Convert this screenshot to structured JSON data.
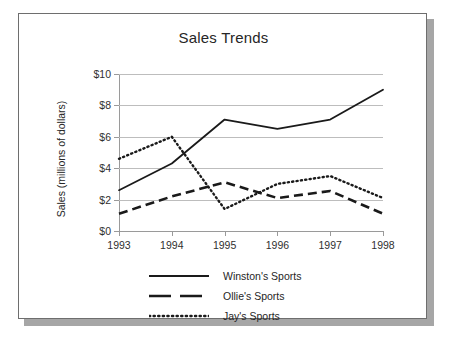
{
  "card": {
    "title": "Sales Trends"
  },
  "chart_data": {
    "type": "line",
    "title": "Sales Trends",
    "xlabel": "",
    "ylabel": "Sales (millions of dollars)",
    "x": [
      "1993",
      "1994",
      "1995",
      "1996",
      "1997",
      "1998"
    ],
    "xlim": [
      1993,
      1998
    ],
    "ylim": [
      0,
      10
    ],
    "yticks": [
      "$0",
      "$2",
      "$4",
      "$6",
      "$8",
      "$10"
    ],
    "ytick_values": [
      0,
      2,
      4,
      6,
      8,
      10
    ],
    "grid": true,
    "legend_position": "bottom",
    "series": [
      {
        "name": "Winston's Sports",
        "style": "solid",
        "color": "#1a1a1a",
        "values": [
          2.6,
          4.3,
          7.1,
          6.5,
          7.1,
          9.0
        ]
      },
      {
        "name": "Ollie's Sports",
        "style": "dashed",
        "color": "#1a1a1a",
        "values": [
          1.1,
          2.2,
          3.1,
          2.1,
          2.55,
          1.1
        ]
      },
      {
        "name": "Jay's Sports",
        "style": "dotted",
        "color": "#1a1a1a",
        "values": [
          4.6,
          6.0,
          1.4,
          3.0,
          3.5,
          2.1
        ]
      }
    ],
    "annotations": []
  },
  "legend": {
    "items": [
      {
        "label": "Winston's Sports",
        "style": "solid"
      },
      {
        "label": "Ollie's Sports",
        "style": "dashed"
      },
      {
        "label": "Jay's Sports",
        "style": "dotted"
      }
    ]
  }
}
